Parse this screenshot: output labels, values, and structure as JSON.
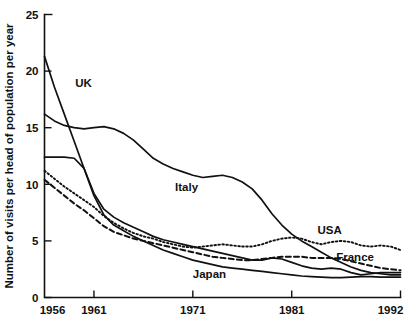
{
  "chart_data": {
    "type": "line",
    "title": "",
    "xlabel": "",
    "ylabel": "Number of visits per head of population per year",
    "xlim": [
      1956,
      1992
    ],
    "ylim": [
      0,
      25
    ],
    "xticks": [
      1956,
      1961,
      1971,
      1981,
      1992
    ],
    "xtick_labels": [
      "1956",
      "1961",
      "1971",
      "1981",
      "1992"
    ],
    "yticks": [
      0,
      5,
      10,
      15,
      20,
      25
    ],
    "ytick_labels": [
      "0",
      "5",
      "10",
      "15",
      "20",
      "25"
    ],
    "grid": false,
    "legend": "inline-labels",
    "x": [
      1956,
      1957,
      1958,
      1959,
      1960,
      1961,
      1962,
      1963,
      1964,
      1965,
      1966,
      1967,
      1968,
      1969,
      1970,
      1971,
      1972,
      1973,
      1974,
      1975,
      1976,
      1977,
      1978,
      1979,
      1980,
      1981,
      1982,
      1983,
      1984,
      1985,
      1986,
      1987,
      1988,
      1989,
      1990,
      1991,
      1992
    ],
    "series": [
      {
        "name": "UK",
        "style": "solid",
        "label_x": 1959.1,
        "label_y": 18.6,
        "values": [
          21.3,
          18.6,
          16.2,
          13.8,
          11.4,
          9.0,
          7.3,
          6.4,
          5.9,
          5.4,
          5.0,
          4.6,
          4.2,
          3.9,
          3.6,
          3.3,
          3.1,
          2.9,
          2.7,
          2.6,
          2.5,
          2.4,
          2.3,
          2.2,
          2.1,
          2.0,
          1.9,
          1.85,
          1.8,
          1.75,
          1.75,
          1.8,
          1.85,
          1.85,
          1.8,
          1.8,
          1.8
        ]
      },
      {
        "name": "Italy",
        "style": "solid",
        "label_x": 1969.2,
        "label_y": 9.4,
        "values": [
          16.2,
          15.6,
          15.2,
          15.0,
          14.9,
          15.0,
          15.1,
          14.9,
          14.5,
          13.9,
          13.1,
          12.3,
          11.8,
          11.4,
          11.1,
          10.8,
          10.6,
          10.7,
          10.8,
          10.6,
          10.2,
          9.6,
          8.6,
          7.4,
          6.4,
          5.6,
          5.0,
          4.5,
          4.0,
          3.5,
          3.1,
          2.7,
          2.4,
          2.2,
          2.1,
          2.0,
          2.0
        ]
      },
      {
        "name": "Japan",
        "style": "solid",
        "label_x": 1971.0,
        "label_y": 1.75,
        "values": [
          12.4,
          12.4,
          12.4,
          12.3,
          11.4,
          9.2,
          7.8,
          7.1,
          6.6,
          6.2,
          5.8,
          5.4,
          5.1,
          4.9,
          4.7,
          4.5,
          4.3,
          4.1,
          3.9,
          3.7,
          3.5,
          3.3,
          3.3,
          3.5,
          3.4,
          3.1,
          2.8,
          2.6,
          2.5,
          2.6,
          2.5,
          2.2,
          2.0,
          2.1,
          2.2,
          2.2,
          2.2
        ]
      },
      {
        "name": "USA",
        "style": "dotted",
        "label_x": 1983.6,
        "label_y": 5.6,
        "values": [
          11.2,
          10.5,
          9.8,
          9.2,
          8.6,
          8.0,
          7.2,
          6.6,
          6.1,
          5.7,
          5.4,
          5.2,
          4.9,
          4.7,
          4.5,
          4.4,
          4.5,
          4.6,
          4.7,
          4.6,
          4.5,
          4.5,
          4.7,
          5.0,
          5.2,
          5.3,
          5.2,
          4.9,
          4.7,
          4.9,
          5.0,
          4.9,
          4.6,
          4.5,
          4.6,
          4.5,
          4.2
        ]
      },
      {
        "name": "France",
        "style": "dashed",
        "label_x": 1985.5,
        "label_y": 3.2,
        "values": [
          10.4,
          9.7,
          9.0,
          8.3,
          7.7,
          7.0,
          6.3,
          5.8,
          5.5,
          5.2,
          5.0,
          4.8,
          4.6,
          4.4,
          4.2,
          4.0,
          3.8,
          3.6,
          3.5,
          3.4,
          3.3,
          3.3,
          3.4,
          3.5,
          3.6,
          3.6,
          3.6,
          3.5,
          3.5,
          3.5,
          3.4,
          3.2,
          3.0,
          2.8,
          2.6,
          2.5,
          2.4
        ]
      }
    ]
  }
}
